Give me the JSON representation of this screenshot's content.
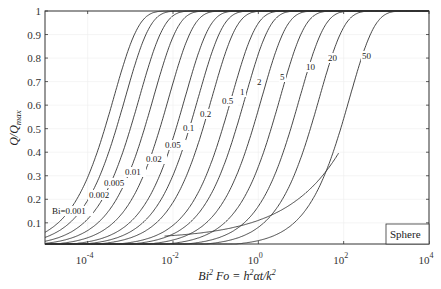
{
  "chart_data": {
    "type": "line",
    "title": "",
    "xlabel": "Bi^2 Fo = h^2 αt/k^2",
    "ylabel": "Q/Q_max",
    "xscale": "log",
    "xlim": [
      1e-05,
      10000
    ],
    "ylim": [
      0.01,
      1
    ],
    "grid": true,
    "x_ticks": [
      {
        "value": -4,
        "label": "10",
        "exp": "-4"
      },
      {
        "value": -2,
        "label": "10",
        "exp": "-2"
      },
      {
        "value": 0,
        "label": "10",
        "exp": "0"
      },
      {
        "value": 2,
        "label": "10",
        "exp": "2"
      },
      {
        "value": 4,
        "label": "10",
        "exp": "4"
      }
    ],
    "y_ticks": [
      "0.1",
      "0.2",
      "0.3",
      "0.4",
      "0.5",
      "0.6",
      "0.7",
      "0.8",
      "0.9",
      "1"
    ],
    "legend": {
      "text": "Sphere",
      "position": "lower right"
    },
    "series": [
      {
        "name": "Bi=0.001",
        "label": "Bi=0.001",
        "log10_x_at_half": -3.6
      },
      {
        "name": "0.002",
        "label": "0.002",
        "log10_x_at_half": -3.33
      },
      {
        "name": "0.005",
        "label": "0.005",
        "log10_x_at_half": -3.0
      },
      {
        "name": "0.01",
        "label": "0.01",
        "log10_x_at_half": -2.67
      },
      {
        "name": "0.02",
        "label": "0.02",
        "log10_x_at_half": -2.31
      },
      {
        "name": "0.05",
        "label": "0.05",
        "log10_x_at_half": -1.93
      },
      {
        "name": "0.1",
        "label": "0.1",
        "log10_x_at_half": -1.62
      },
      {
        "name": "0.2",
        "label": "0.2",
        "log10_x_at_half": -1.3
      },
      {
        "name": "0.5",
        "label": "0.5",
        "log10_x_at_half": -0.84
      },
      {
        "name": "1",
        "label": "1",
        "log10_x_at_half": -0.52
      },
      {
        "name": "2",
        "label": "2",
        "log10_x_at_half": -0.13
      },
      {
        "name": "5",
        "label": "5",
        "log10_x_at_half": 0.3
      },
      {
        "name": "10",
        "label": "10",
        "log10_x_at_half": 0.76
      },
      {
        "name": "20",
        "label": "20",
        "log10_x_at_half": 1.22
      },
      {
        "name": "50",
        "label": "50",
        "log10_x_at_half": 1.93
      }
    ],
    "label_positions": [
      {
        "text": "Bi=0.001",
        "x": 52,
        "y": 214
      },
      {
        "text": "0.002",
        "x": 89,
        "y": 198
      },
      {
        "text": "0.005",
        "x": 104,
        "y": 186
      },
      {
        "text": "0.01",
        "x": 125,
        "y": 175
      },
      {
        "text": "0.02",
        "x": 146,
        "y": 162
      },
      {
        "text": "0.05",
        "x": 165,
        "y": 148
      },
      {
        "text": "0.1",
        "x": 183,
        "y": 131
      },
      {
        "text": "0.2",
        "x": 200,
        "y": 117
      },
      {
        "text": "0.5",
        "x": 222,
        "y": 104
      },
      {
        "text": "1",
        "x": 240,
        "y": 95
      },
      {
        "text": "2",
        "x": 257,
        "y": 85
      },
      {
        "text": "5",
        "x": 280,
        "y": 80
      },
      {
        "text": "10",
        "x": 306,
        "y": 70
      },
      {
        "text": "20",
        "x": 328,
        "y": 61
      },
      {
        "text": "50",
        "x": 362,
        "y": 59
      }
    ]
  }
}
